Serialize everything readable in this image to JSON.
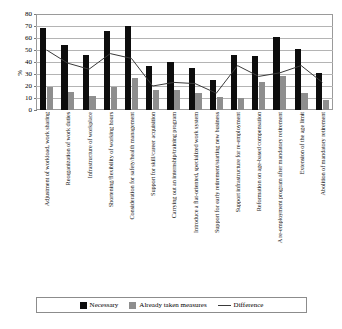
{
  "chart_data": {
    "type": "bar",
    "title": "",
    "subtitle": "",
    "xlabel": "",
    "ylabel": "%",
    "ylim": [
      0,
      80
    ],
    "yticks": [
      0,
      10,
      20,
      30,
      40,
      50,
      60,
      70,
      80
    ],
    "grid": true,
    "legend_position": "bottom",
    "categories": [
      "Adjustment of workload, work sharing",
      "Reorganization of work duties",
      "Infrastructure of workplace",
      "Shortening/flexibility of working hours",
      "Consideration for safety/health management",
      "Support for skill/career acquisition",
      "Carrying out an internship/training program",
      "Introduce a flat-oriented, specialized work system",
      "Support for early retirement/starting new business",
      "Support infrastructure for re-employment",
      "Reformation on age-based compensation",
      "A re-employment program after mandatory retirement",
      "Extension of the age limit",
      "Abolition of mandatory retirement"
    ],
    "series": [
      {
        "name": "Necessary",
        "type": "bar",
        "color": "#0d0d0d",
        "values": [
          68,
          54,
          46,
          66,
          70,
          37,
          40,
          35,
          25,
          46,
          45,
          61,
          51,
          31
        ]
      },
      {
        "name": "Already taken measures",
        "type": "bar",
        "color": "#8e8e8e",
        "values": [
          19,
          15,
          12,
          19,
          27,
          17,
          17,
          14,
          11,
          10,
          23,
          28,
          14,
          8
        ]
      },
      {
        "name": "Difference",
        "type": "line",
        "color": "#3a3a3a",
        "values": [
          50,
          39,
          34,
          47,
          43,
          20,
          23,
          22,
          14,
          37,
          28,
          31,
          37,
          23
        ]
      }
    ]
  },
  "legend": {
    "necessary_label": "Necessary",
    "measures_label": "Already taken measures",
    "difference_label": "Difference"
  }
}
